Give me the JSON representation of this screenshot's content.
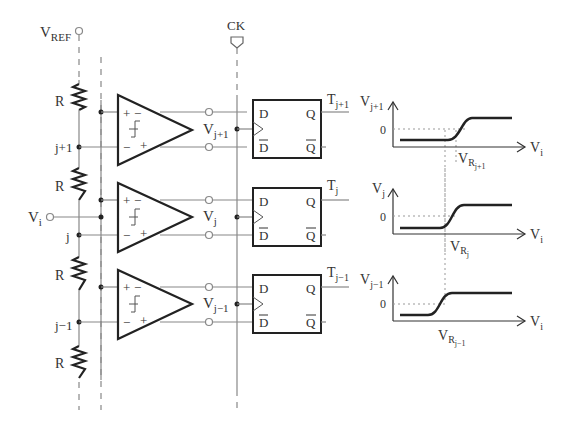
{
  "diagram": {
    "type": "flash ADC comparator array with latches and transfer characteristics",
    "inputs": {
      "vref": {
        "label": "V",
        "sub": "REF"
      },
      "clock": {
        "label": "CK"
      },
      "vin": {
        "label": "V",
        "sub": "i"
      }
    },
    "resistors": [
      {
        "label": "R"
      },
      {
        "label": "R"
      },
      {
        "label": "R"
      },
      {
        "label": "R"
      }
    ],
    "nodes": [
      {
        "label": "j+1"
      },
      {
        "label": "j"
      },
      {
        "label": "j−1"
      }
    ],
    "stages": [
      {
        "comparator_out": {
          "label": "V",
          "sub": "j+1"
        },
        "latch": {
          "d": "D",
          "dbar": "D",
          "q": "Q",
          "qbar": "Q"
        },
        "output": {
          "label": "T",
          "sub": "j+1"
        },
        "plot": {
          "ylabel": "V",
          "ysub": "j+1",
          "zero": "0",
          "xlabel": "V",
          "xsub": "i",
          "threshold": "V",
          "thr_sub": "R",
          "thr_subsub": "j+1"
        }
      },
      {
        "comparator_out": {
          "label": "V",
          "sub": "j"
        },
        "latch": {
          "d": "D",
          "dbar": "D",
          "q": "Q",
          "qbar": "Q"
        },
        "output": {
          "label": "T",
          "sub": "j"
        },
        "plot": {
          "ylabel": "V",
          "ysub": "j",
          "zero": "0",
          "xlabel": "V",
          "xsub": "i",
          "threshold": "V",
          "thr_sub": "R",
          "thr_subsub": "j"
        }
      },
      {
        "comparator_out": {
          "label": "V",
          "sub": "j−1"
        },
        "latch": {
          "d": "D",
          "dbar": "D",
          "q": "Q",
          "qbar": "Q"
        },
        "output": {
          "label": "T",
          "sub": "j−1"
        },
        "plot": {
          "ylabel": "V",
          "ysub": "j−1",
          "zero": "0",
          "xlabel": "V",
          "xsub": "i",
          "threshold": "V",
          "thr_sub": "R",
          "thr_subsub": "j−1"
        }
      }
    ],
    "comparator_signs": {
      "plus": "+",
      "minus": "−"
    }
  }
}
